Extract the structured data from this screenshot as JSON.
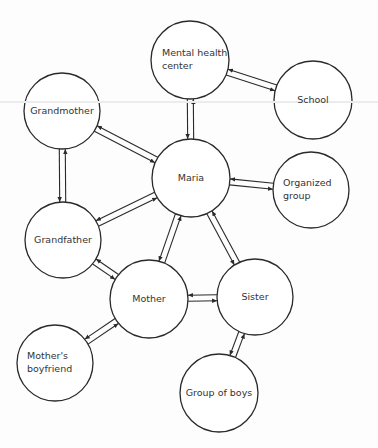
{
  "diagram": {
    "type": "ecomap",
    "center_node": "Maria",
    "nodes": [
      {
        "id": "mental_health_center",
        "label": "Mental health center",
        "lines": [
          "Mental health",
          "center"
        ],
        "cx": 190,
        "cy": 60,
        "r": 39
      },
      {
        "id": "school",
        "label": "School",
        "lines": [
          "School"
        ],
        "cx": 313,
        "cy": 100,
        "r": 39
      },
      {
        "id": "grandmother",
        "label": "Grandmother",
        "lines": [
          "Grandmother"
        ],
        "cx": 62,
        "cy": 111,
        "r": 38
      },
      {
        "id": "maria",
        "label": "Maria",
        "lines": [
          "Maria"
        ],
        "cx": 191,
        "cy": 178,
        "r": 39
      },
      {
        "id": "organized_group",
        "label": "Organized group",
        "lines": [
          "Organized",
          "group"
        ],
        "cx": 311,
        "cy": 190,
        "r": 38
      },
      {
        "id": "grandfather",
        "label": "Grandfather",
        "lines": [
          "Grandfather"
        ],
        "cx": 63,
        "cy": 240,
        "r": 38
      },
      {
        "id": "mother",
        "label": "Mother",
        "lines": [
          "Mother"
        ],
        "cx": 149,
        "cy": 299,
        "r": 39
      },
      {
        "id": "sister",
        "label": "Sister",
        "lines": [
          "Sister"
        ],
        "cx": 255,
        "cy": 297,
        "r": 38
      },
      {
        "id": "mothers_boyfriend",
        "label": "Mother's boyfriend",
        "lines": [
          "Mother's",
          "boyfriend"
        ],
        "cx": 55,
        "cy": 363,
        "r": 38
      },
      {
        "id": "group_of_boys",
        "label": "Group of boys",
        "lines": [
          "Group of boys"
        ],
        "cx": 219,
        "cy": 393,
        "r": 39
      }
    ],
    "edges": [
      {
        "from": "maria",
        "to": "mental_health_center",
        "direction": "bidirectional"
      },
      {
        "from": "mental_health_center",
        "to": "school",
        "direction": "bidirectional"
      },
      {
        "from": "maria",
        "to": "grandmother",
        "direction": "bidirectional"
      },
      {
        "from": "maria",
        "to": "organized_group",
        "direction": "bidirectional"
      },
      {
        "from": "grandmother",
        "to": "grandfather",
        "direction": "bidirectional"
      },
      {
        "from": "maria",
        "to": "grandfather",
        "direction": "bidirectional"
      },
      {
        "from": "maria",
        "to": "mother",
        "direction": "bidirectional"
      },
      {
        "from": "maria",
        "to": "sister",
        "direction": "bidirectional"
      },
      {
        "from": "grandfather",
        "to": "mother",
        "direction": "bidirectional"
      },
      {
        "from": "mother",
        "to": "sister",
        "direction": "bidirectional"
      },
      {
        "from": "mother",
        "to": "mothers_boyfriend",
        "direction": "bidirectional"
      },
      {
        "from": "sister",
        "to": "group_of_boys",
        "direction": "bidirectional"
      }
    ],
    "style": {
      "stroke": "#2a2a2a",
      "text": "#333333",
      "background": "#fdfdfd"
    }
  }
}
